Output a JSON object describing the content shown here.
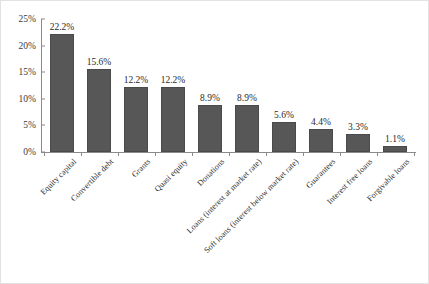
{
  "chart_data": {
    "type": "bar",
    "title": "",
    "subtitle": "",
    "xlabel": "",
    "ylabel": "",
    "ylim": [
      0,
      25
    ],
    "ytick_labels": [
      "0%",
      "5%",
      "10%",
      "15%",
      "20%",
      "25%"
    ],
    "ytick_values": [
      0,
      5,
      10,
      15,
      20,
      25
    ],
    "grid": false,
    "legend": false,
    "legend_position": "none",
    "bar_color": "#575757",
    "axis_color": "#8a8a8a",
    "categories": [
      "Equity capital",
      "Convertible debt",
      "Grants",
      "Quasi equity",
      "Donations",
      "Loans (interest at market rate)",
      "Soft loans (interest below market rate)",
      "Guarantees",
      "Interest free loans",
      "Forgivable loans"
    ],
    "values": [
      22.2,
      15.6,
      12.2,
      12.2,
      8.9,
      8.9,
      5.6,
      4.4,
      3.3,
      1.1
    ],
    "value_labels": [
      "22.2%",
      "15.6%",
      "12.2%",
      "12.2%",
      "8.9%",
      "8.9%",
      "5.6%",
      "4.4%",
      "3.3%",
      "1.1%"
    ]
  }
}
